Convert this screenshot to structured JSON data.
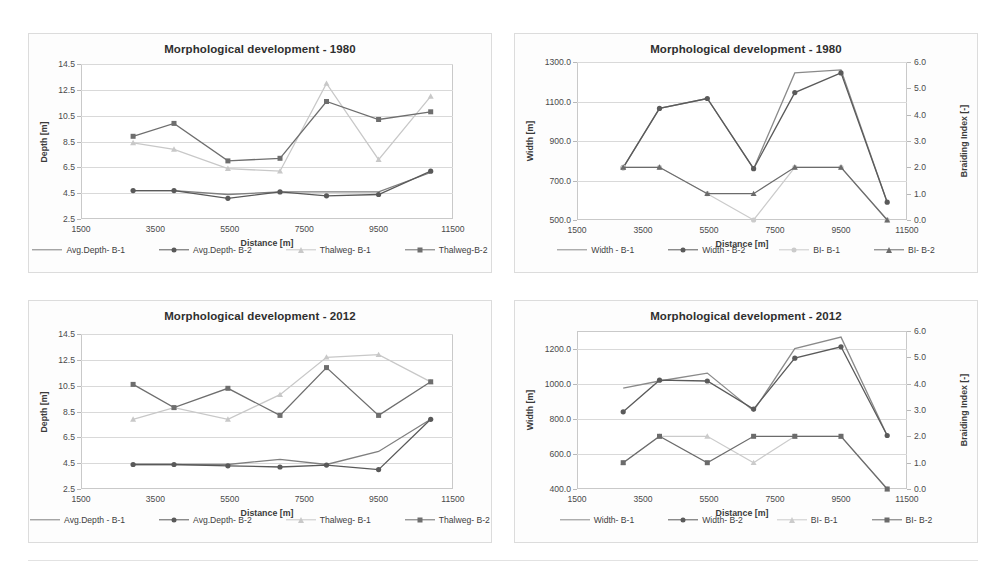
{
  "figure": {
    "background": "#ffffff",
    "panel_border": "#dcdcdc"
  },
  "colors": {
    "series_b1_depth": "#7f7f7f",
    "series_b2_depth": "#595959",
    "thalweg_b1": "#c8c8c8",
    "thalweg_b2": "#6e6e6e",
    "width_b1": "#8a8a8a",
    "width_b2": "#5a5a5a",
    "bi_b1": "#cbcbcb",
    "bi_b2": "#6b6b6b",
    "gridline": "#d9d9d9",
    "axis": "#c9c9c9",
    "text": "#3a3a3a"
  },
  "charts": [
    {
      "id": "depth-1980",
      "chart_data": {
        "type": "line",
        "title": "Morphological development - 1980",
        "xlabel": "Distance  [m]",
        "ylabel": "Depth [m]",
        "xlim": [
          1500,
          11500
        ],
        "ylim": [
          2.5,
          14.5
        ],
        "xticks": [
          "1500",
          "3500",
          "5500",
          "7500",
          "9500",
          "11500"
        ],
        "xtick_values": [
          1500,
          3500,
          5500,
          7500,
          9500,
          11500
        ],
        "yticks": [
          "2.5",
          "4.5",
          "6.5",
          "8.5",
          "10.5",
          "12.5",
          "14.5"
        ],
        "ytick_values": [
          2.5,
          4.5,
          6.5,
          8.5,
          10.5,
          12.5,
          14.5
        ],
        "grid": true,
        "legend_position": "bottom",
        "x": [
          2900,
          4000,
          5450,
          6850,
          8100,
          9500,
          10900
        ],
        "series": [
          {
            "name": "Avg.Depth- B-1",
            "key": "series_b1_depth",
            "marker": "none",
            "axis": "left",
            "values": [
              4.7,
              4.7,
              4.4,
              4.6,
              4.6,
              4.6,
              6.1
            ]
          },
          {
            "name": "Avg.Depth- B-2",
            "key": "series_b2_depth",
            "marker": "circle",
            "axis": "left",
            "values": [
              4.7,
              4.7,
              4.1,
              4.6,
              4.3,
              4.4,
              6.2
            ]
          },
          {
            "name": "Thalweg- B-1",
            "key": "thalweg_b1",
            "marker": "triangle",
            "axis": "left",
            "values": [
              8.4,
              7.9,
              6.4,
              6.2,
              13.0,
              7.1,
              12.0
            ]
          },
          {
            "name": "Thalweg-B-2",
            "key": "thalweg_b2",
            "marker": "square",
            "axis": "left",
            "values": [
              8.9,
              9.9,
              7.0,
              7.2,
              11.6,
              10.2,
              10.8
            ]
          }
        ]
      }
    },
    {
      "id": "width-1980",
      "chart_data": {
        "type": "line",
        "title": "Morphological development - 1980",
        "xlabel": "Distance  [m]",
        "ylabel": "Width [m]",
        "ylabel_right": "Braiding Index [-]",
        "xlim": [
          1500,
          11500
        ],
        "ylim": [
          500,
          1300
        ],
        "ylim_right": [
          0.0,
          6.0
        ],
        "xticks": [
          "1500",
          "3500",
          "5500",
          "7500",
          "9500",
          "11500"
        ],
        "xtick_values": [
          1500,
          3500,
          5500,
          7500,
          9500,
          11500
        ],
        "yticks": [
          "500.0",
          "700.0",
          "900.0",
          "1100.0",
          "1300.0"
        ],
        "ytick_values": [
          500,
          700,
          900,
          1100,
          1300
        ],
        "yticks_right": [
          "0.0",
          "1.0",
          "2.0",
          "3.0",
          "4.0",
          "5.0",
          "6.0"
        ],
        "ytick_values_right": [
          0,
          1,
          2,
          3,
          4,
          5,
          6
        ],
        "grid": true,
        "legend_position": "bottom",
        "x": [
          2900,
          4000,
          5450,
          6850,
          8100,
          9500,
          10900
        ],
        "series": [
          {
            "name": "Width - B-1",
            "key": "width_b1",
            "marker": "none",
            "axis": "left",
            "values": [
              765,
              1065,
              1115,
              760,
              1245,
              1260,
              590
            ]
          },
          {
            "name": "Width - B-2",
            "key": "width_b2",
            "marker": "circle",
            "axis": "left",
            "values": [
              765,
              1065,
              1115,
              760,
              1145,
              1245,
              590
            ]
          },
          {
            "name": "BI- B-1",
            "key": "bi_b1",
            "marker": "circle",
            "axis": "right",
            "values": [
              2.0,
              2.0,
              1.0,
              0.0,
              2.0,
              2.0,
              0.0
            ]
          },
          {
            "name": "BI- B-2",
            "key": "bi_b2",
            "marker": "triangle",
            "axis": "right",
            "values": [
              2.0,
              2.0,
              1.0,
              1.0,
              2.0,
              2.0,
              0.0
            ]
          }
        ]
      }
    },
    {
      "id": "depth-2012",
      "chart_data": {
        "type": "line",
        "title": "Morphological development - 2012",
        "xlabel": "Distance  [m]",
        "ylabel": "Depth [m]",
        "xlim": [
          1500,
          11500
        ],
        "ylim": [
          2.5,
          14.5
        ],
        "xticks": [
          "1500",
          "3500",
          "5500",
          "7500",
          "9500",
          "11500"
        ],
        "xtick_values": [
          1500,
          3500,
          5500,
          7500,
          9500,
          11500
        ],
        "yticks": [
          "2.5",
          "4.5",
          "6.5",
          "8.5",
          "10.5",
          "12.5",
          "14.5"
        ],
        "ytick_values": [
          2.5,
          4.5,
          6.5,
          8.5,
          10.5,
          12.5,
          14.5
        ],
        "grid": true,
        "legend_position": "bottom",
        "x": [
          2900,
          4000,
          5450,
          6850,
          8100,
          9500,
          10900
        ],
        "series": [
          {
            "name": "Avg.Depth - B-1",
            "key": "series_b1_depth",
            "marker": "none",
            "axis": "left",
            "values": [
              4.4,
              4.4,
              4.4,
              4.8,
              4.4,
              5.4,
              7.9
            ]
          },
          {
            "name": "Avg.Depth- B-2",
            "key": "series_b2_depth",
            "marker": "circle",
            "axis": "left",
            "values": [
              4.4,
              4.4,
              4.3,
              4.2,
              4.35,
              4.0,
              7.9
            ]
          },
          {
            "name": "Thalweg- B-1",
            "key": "thalweg_b1",
            "marker": "triangle",
            "axis": "left",
            "values": [
              7.9,
              8.8,
              7.9,
              9.8,
              12.7,
              12.9,
              10.8
            ]
          },
          {
            "name": "Thalweg- B-2",
            "key": "thalweg_b2",
            "marker": "square",
            "axis": "left",
            "values": [
              10.6,
              8.8,
              10.3,
              8.2,
              11.9,
              8.2,
              10.8
            ]
          }
        ]
      }
    },
    {
      "id": "width-2012",
      "chart_data": {
        "type": "line",
        "title": "Morphological development - 2012",
        "xlabel": "Distance  [m]",
        "ylabel": "Width [m]",
        "ylabel_right": "Braiding Index [-]",
        "xlim": [
          1500,
          11500
        ],
        "ylim": [
          400,
          1300
        ],
        "ylim_right": [
          0.0,
          6.0
        ],
        "xticks": [
          "1500",
          "3500",
          "5500",
          "7500",
          "9500",
          "11500"
        ],
        "xtick_values": [
          1500,
          3500,
          5500,
          7500,
          9500,
          11500
        ],
        "yticks": [
          "400.0",
          "600.0",
          "800.0",
          "1000.0",
          "1200.0"
        ],
        "ytick_values": [
          400,
          600,
          800,
          1000,
          1200
        ],
        "yticks_right": [
          "0.0",
          "1.0",
          "2.0",
          "3.0",
          "4.0",
          "5.0",
          "6.0"
        ],
        "ytick_values_right": [
          0,
          1,
          2,
          3,
          4,
          5,
          6
        ],
        "grid": true,
        "legend_position": "bottom",
        "x": [
          2900,
          4000,
          5450,
          6850,
          8100,
          9500,
          10900
        ],
        "series": [
          {
            "name": "Width- B-1",
            "key": "width_b1",
            "marker": "none",
            "axis": "left",
            "values": [
              975,
              1015,
              1060,
              845,
              1200,
              1265,
              705
            ]
          },
          {
            "name": "Width- B-2",
            "key": "width_b2",
            "marker": "circle",
            "axis": "left",
            "values": [
              840,
              1020,
              1015,
              855,
              1145,
              1210,
              705
            ]
          },
          {
            "name": "BI- B-1",
            "key": "bi_b1",
            "marker": "triangle",
            "axis": "right",
            "values": [
              1.0,
              2.0,
              2.0,
              1.0,
              2.0,
              2.0,
              0.0
            ]
          },
          {
            "name": "BI- B-2",
            "key": "bi_b2",
            "marker": "square",
            "axis": "right",
            "values": [
              1.0,
              2.0,
              1.0,
              2.0,
              2.0,
              2.0,
              0.0
            ]
          }
        ]
      }
    }
  ]
}
